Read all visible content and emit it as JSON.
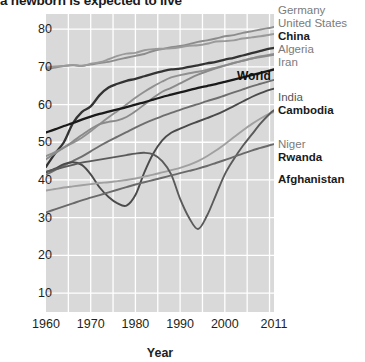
{
  "title": "a newborn is expected to live",
  "axes": {
    "x_label": "Year",
    "y_ticks": [
      "10",
      "20",
      "30",
      "40",
      "50",
      "60",
      "70",
      "80"
    ],
    "x_ticks": [
      "1960",
      "1970",
      "1980",
      "1990",
      "2000",
      "2011"
    ]
  },
  "annotation": {
    "world": "World"
  },
  "legend": {
    "items": [
      {
        "label": "Germany",
        "color": "#8c8c8c",
        "weight": "light"
      },
      {
        "label": "United States",
        "color": "#9a9a9a",
        "weight": "light"
      },
      {
        "label": "China",
        "color": "#333333",
        "weight": "bold"
      },
      {
        "label": "Algeria",
        "color": "#909090",
        "weight": "light"
      },
      {
        "label": "Iran",
        "color": "#8a8a8a",
        "weight": "light"
      },
      {
        "label": "India",
        "color": "#6e6e6e",
        "weight": "mid"
      },
      {
        "label": "Cambodia",
        "color": "#4a4a4a",
        "weight": "bold"
      },
      {
        "label": "Niger",
        "color": "#a0a0a0",
        "weight": "light"
      },
      {
        "label": "Rwanda",
        "color": "#5a5a5a",
        "weight": "bold"
      },
      {
        "label": "Afghanistan",
        "color": "#6a6a6a",
        "weight": "bold"
      }
    ]
  },
  "chart_data": {
    "type": "line",
    "title": "a newborn is expected to live",
    "xlabel": "Year",
    "ylabel": "",
    "xlim": [
      1960,
      2011
    ],
    "ylim": [
      5,
      84
    ],
    "grid": true,
    "legend_position": "right",
    "x": [
      1960,
      1962,
      1964,
      1966,
      1968,
      1970,
      1972,
      1974,
      1976,
      1978,
      1980,
      1982,
      1984,
      1986,
      1988,
      1990,
      1992,
      1994,
      1996,
      1998,
      2000,
      2002,
      2004,
      2006,
      2008,
      2010,
      2011
    ],
    "series": [
      {
        "name": "Germany",
        "color": "#8c8c8c",
        "values": [
          69.3,
          69.8,
          70.2,
          70.4,
          70.3,
          70.6,
          71.0,
          71.3,
          71.9,
          72.4,
          72.9,
          73.4,
          74.2,
          74.7,
          75.2,
          75.5,
          76.0,
          76.6,
          77.0,
          77.5,
          78.1,
          78.4,
          79.0,
          79.4,
          79.9,
          80.3,
          80.6
        ]
      },
      {
        "name": "United States",
        "color": "#9a9a9a",
        "values": [
          69.8,
          70.1,
          70.2,
          70.5,
          70.2,
          70.8,
          71.2,
          72.0,
          72.9,
          73.5,
          73.7,
          74.4,
          74.7,
          74.8,
          74.9,
          75.2,
          75.6,
          75.7,
          76.1,
          76.7,
          76.8,
          77.0,
          77.5,
          77.8,
          78.1,
          78.5,
          78.7
        ]
      },
      {
        "name": "China",
        "color": "#333333",
        "values": [
          43.5,
          47.0,
          50.0,
          55.0,
          58.0,
          59.5,
          62.5,
          64.5,
          65.5,
          66.3,
          66.8,
          67.5,
          68.2,
          68.8,
          69.3,
          69.5,
          70.0,
          70.4,
          70.9,
          71.3,
          71.9,
          72.4,
          73.0,
          73.6,
          74.2,
          74.8,
          75.0
        ]
      },
      {
        "name": "Algeria",
        "color": "#909090",
        "values": [
          46.3,
          47.4,
          48.6,
          49.8,
          51.2,
          52.9,
          54.8,
          56.6,
          58.3,
          60.0,
          61.8,
          63.4,
          64.8,
          66.1,
          67.2,
          67.8,
          68.3,
          68.7,
          69.2,
          69.8,
          70.4,
          71.0,
          71.6,
          72.2,
          72.8,
          73.2,
          73.4
        ]
      },
      {
        "name": "Iran",
        "color": "#8a8a8a",
        "values": [
          45.5,
          47.0,
          48.6,
          50.2,
          51.9,
          53.5,
          54.8,
          55.4,
          55.8,
          56.7,
          58.2,
          60.0,
          61.8,
          63.4,
          64.4,
          65.6,
          66.8,
          67.9,
          68.8,
          69.6,
          70.3,
          71.0,
          71.6,
          72.2,
          72.6,
          73.0,
          73.2
        ]
      },
      {
        "name": "World",
        "color": "#1a1a1a",
        "values": [
          52.6,
          53.4,
          54.3,
          55.1,
          56.0,
          56.8,
          57.5,
          58.1,
          58.7,
          59.3,
          60.0,
          60.6,
          61.3,
          62.0,
          62.6,
          63.2,
          63.8,
          64.4,
          64.9,
          65.4,
          66.0,
          66.6,
          67.2,
          67.8,
          68.4,
          69.0,
          69.3
        ]
      },
      {
        "name": "India",
        "color": "#6e6e6e",
        "values": [
          41.4,
          42.6,
          43.8,
          45.0,
          46.2,
          47.6,
          49.0,
          50.3,
          51.5,
          52.7,
          53.9,
          55.0,
          56.0,
          56.9,
          57.8,
          58.6,
          59.4,
          60.1,
          60.9,
          61.6,
          62.4,
          63.2,
          64.0,
          64.8,
          65.5,
          66.2,
          66.5
        ]
      },
      {
        "name": "Cambodia",
        "color": "#4a4a4a",
        "values": [
          42.0,
          43.0,
          44.2,
          44.7,
          44.0,
          41.5,
          38.0,
          35.5,
          33.8,
          33.2,
          36.0,
          42.0,
          47.0,
          50.5,
          52.5,
          53.6,
          54.6,
          55.5,
          56.4,
          57.3,
          58.4,
          59.6,
          60.8,
          62.0,
          63.0,
          63.9,
          64.2
        ]
      },
      {
        "name": "Niger",
        "color": "#a0a0a0",
        "values": [
          37.2,
          37.6,
          38.0,
          38.3,
          38.6,
          38.9,
          39.2,
          39.4,
          39.7,
          40.0,
          40.4,
          40.9,
          41.4,
          42.0,
          42.6,
          43.2,
          44.0,
          45.0,
          46.3,
          47.8,
          49.5,
          51.3,
          53.1,
          54.8,
          56.3,
          57.6,
          58.0
        ]
      },
      {
        "name": "Rwanda",
        "color": "#5a5a5a",
        "values": [
          42.2,
          42.8,
          43.4,
          44.0,
          44.6,
          45.0,
          45.4,
          45.8,
          46.2,
          46.6,
          47.0,
          47.2,
          46.8,
          45.0,
          41.5,
          35.0,
          30.0,
          27.0,
          30.5,
          36.0,
          41.5,
          45.5,
          49.0,
          52.0,
          55.0,
          57.5,
          58.5
        ]
      },
      {
        "name": "Afghanistan",
        "color": "#6a6a6a",
        "values": [
          31.4,
          32.2,
          33.0,
          33.8,
          34.6,
          35.3,
          36.0,
          36.7,
          37.4,
          38.1,
          38.8,
          39.4,
          40.0,
          40.6,
          41.2,
          41.8,
          42.4,
          43.0,
          43.7,
          44.5,
          45.3,
          46.1,
          47.0,
          47.8,
          48.5,
          49.2,
          49.5
        ]
      }
    ]
  }
}
